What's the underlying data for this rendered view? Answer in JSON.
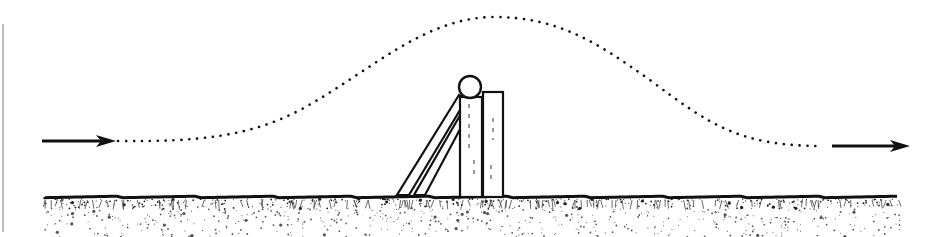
{
  "diagram": {
    "type": "trajectory-illustration",
    "width": 944,
    "height": 237,
    "colors": {
      "ink": "#111111",
      "background": "#ffffff",
      "border": "#bdbdbd"
    },
    "left_border": {
      "x": 3,
      "y1": 24,
      "y2": 232
    },
    "arrow_in": {
      "x1": 42,
      "x2": 116,
      "y": 141,
      "direction": "right"
    },
    "arrow_out": {
      "x1": 832,
      "x2": 910,
      "y": 146,
      "direction": "right"
    },
    "trajectory": {
      "style": "dotted",
      "path": "M118,141 C200,142 250,136 300,110 C370,72 420,20 490,17 C560,16 600,45 650,80 C710,125 740,146 822,146"
    },
    "ground": {
      "y": 197,
      "x1": 45,
      "x2": 900
    },
    "obstacle": {
      "ball": {
        "cx": 470,
        "cy": 87,
        "r": 11
      },
      "post_left": {
        "x": 460,
        "y": 97,
        "w": 22,
        "h": 100
      },
      "post_right": {
        "x": 483,
        "y": 92,
        "w": 20,
        "h": 105
      },
      "slanted_board": {
        "points": "397,195 409,195 466,100 459,95"
      },
      "slanted_board_inner": {
        "points": "414,195 425,195 466,118 466,105"
      }
    }
  }
}
